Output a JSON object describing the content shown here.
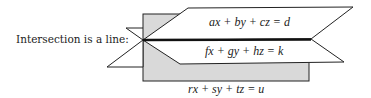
{
  "caption": "Intersection is a line:",
  "planes": {
    "top": {
      "equation": "ax + by + cz = d"
    },
    "middle": {
      "equation": "fx + gy + hz = k"
    },
    "back": {
      "equation": "rx + sy + tz = u"
    }
  },
  "colors": {
    "back_plane_fill": "#d9d9d9",
    "stroke": "#222222",
    "plane_fill": "#ffffff"
  }
}
